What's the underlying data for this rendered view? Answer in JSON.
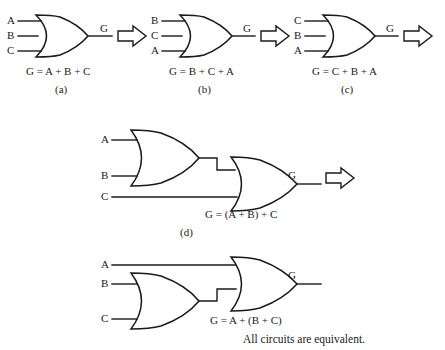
{
  "figure": {
    "background_color": "#ffffff",
    "line_color": "#1a1a1a",
    "footer_note": "All circuits are equivalent."
  },
  "circuits": [
    {
      "id": "a",
      "caption": "(a)",
      "equation": "G = A + B + C",
      "gate_type": "OR",
      "inputs": [
        "A",
        "B",
        "C"
      ],
      "output": "G"
    },
    {
      "id": "b",
      "caption": "(b)",
      "equation": "G = B + C + A",
      "gate_type": "OR",
      "inputs": [
        "B",
        "C",
        "A"
      ],
      "output": "G"
    },
    {
      "id": "c",
      "caption": "(c)",
      "equation": "G = C + B + A",
      "gate_type": "OR",
      "inputs": [
        "C",
        "B",
        "A"
      ],
      "output": "G"
    },
    {
      "id": "d",
      "caption": "(d)",
      "equation": "G = (A + B) + C",
      "gate_type": "OR",
      "inputs": [
        "A",
        "B",
        "C"
      ],
      "output": "G",
      "stage1_inputs": [
        "A",
        "B"
      ],
      "stage2_inputs": [
        "(A+B)",
        "C"
      ]
    },
    {
      "id": "e",
      "caption": "",
      "equation": "G = A + (B + C)",
      "gate_type": "OR",
      "inputs": [
        "A",
        "B",
        "C"
      ],
      "output": "G",
      "stage1_inputs": [
        "B",
        "C"
      ],
      "stage2_inputs": [
        "A",
        "(B+C)"
      ]
    }
  ],
  "arrows": [
    {
      "name": "arrow-a-to-b"
    },
    {
      "name": "arrow-b-to-c"
    },
    {
      "name": "arrow-c-to-d"
    },
    {
      "name": "arrow-d-to-e"
    }
  ]
}
